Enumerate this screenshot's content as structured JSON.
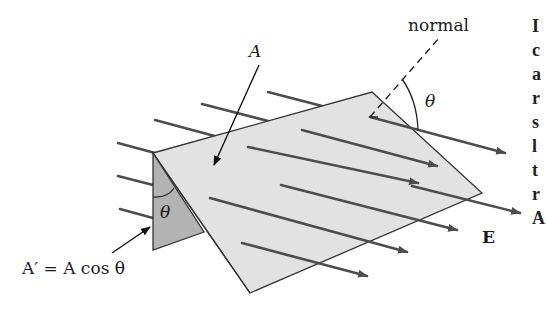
{
  "figure": {
    "labels": {
      "normal": "normal",
      "area": "A",
      "theta_top": "θ",
      "theta_side": "θ",
      "projected_area": "A′ = A cos θ",
      "field": "E"
    },
    "side_text_fragments": [
      "I",
      "c",
      "a",
      "r",
      "s",
      "l",
      "t",
      "r",
      "A"
    ]
  },
  "colors": {
    "plane_fill": "#e2e2e2",
    "plane_edge": "#333333",
    "shaded_fill": "#b3b3b3",
    "field_line": "#4d4d4d",
    "text": "#1a1a1a"
  }
}
